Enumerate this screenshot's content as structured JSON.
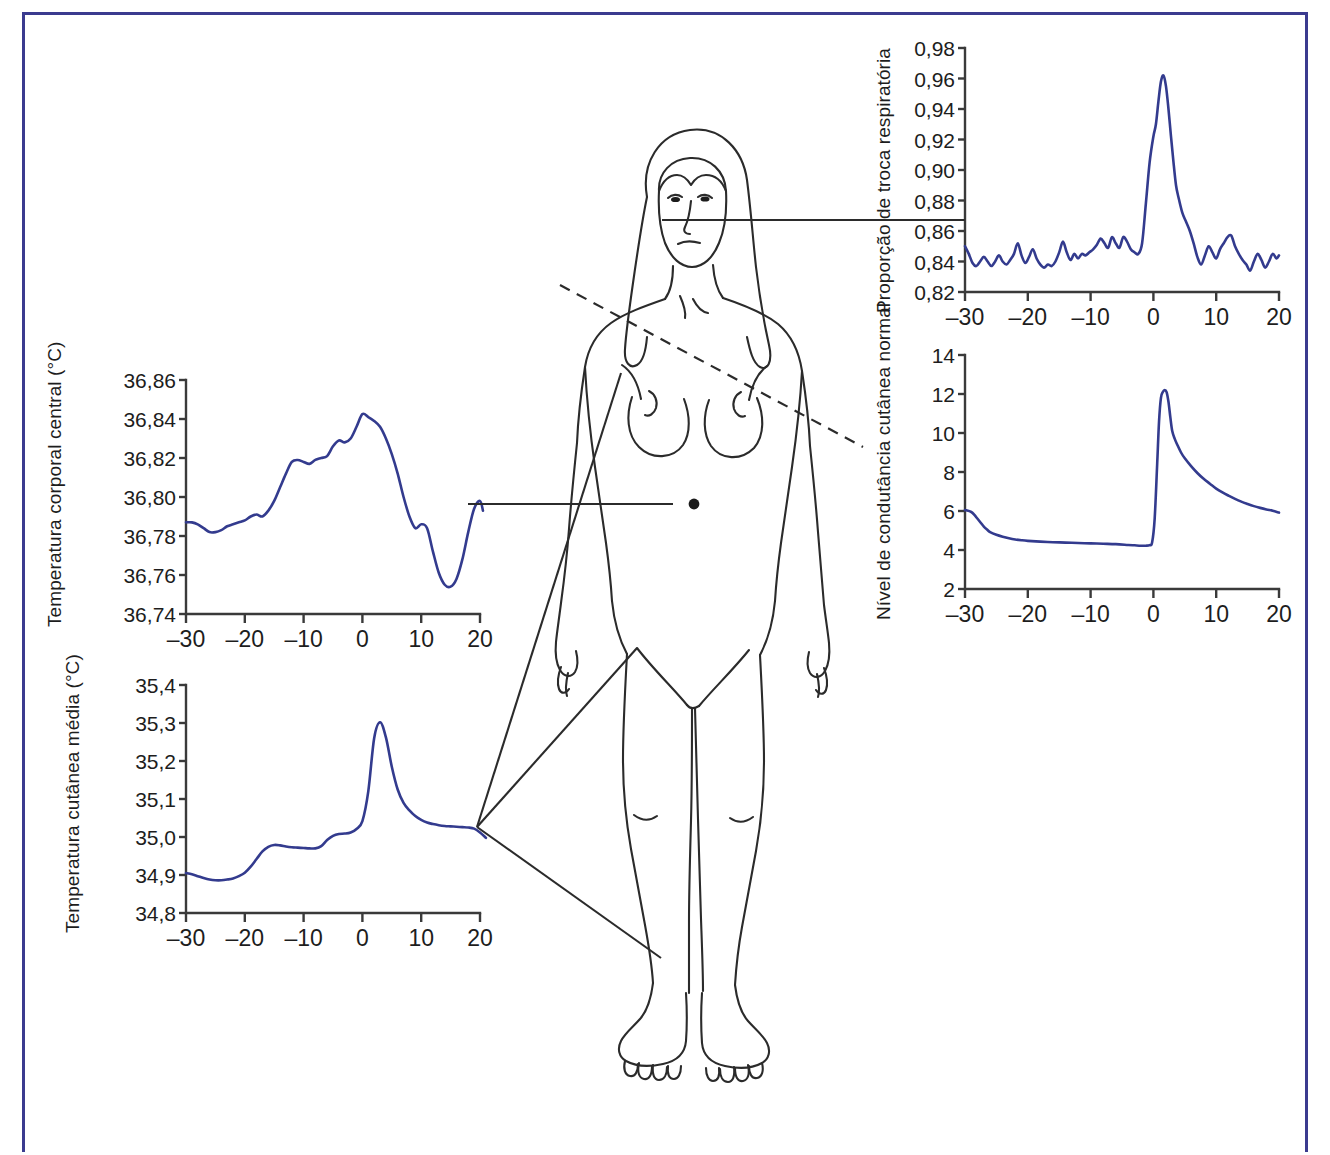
{
  "figure": {
    "border_color": "#3b3b8f",
    "curve_color": "#333b8e",
    "body_line_color": "#2b2b2b"
  },
  "chart_data": [
    {
      "id": "core-body-temperature",
      "type": "line",
      "title": "",
      "ylabel": "Temperatura corporal central (°C)",
      "xlabel": "",
      "xlim": [
        -30,
        20
      ],
      "ylim": [
        36.74,
        36.86
      ],
      "xticks": [
        -30,
        -20,
        -10,
        0,
        10,
        20
      ],
      "xticklabels": [
        "–30",
        "–20",
        "–10",
        "0",
        "10",
        "20"
      ],
      "yticks": [
        36.74,
        36.76,
        36.78,
        36.8,
        36.82,
        36.84,
        36.86
      ],
      "yticklabels": [
        "36,74",
        "36,76",
        "36,78",
        "36,80",
        "36,82",
        "36,84",
        "36,86"
      ],
      "grid": false,
      "legend": "none",
      "x": [
        -30,
        -29,
        -28,
        -27,
        -26,
        -25,
        -24,
        -23,
        -22,
        -21,
        -20,
        -19,
        -18,
        -17,
        -16,
        -15,
        -14,
        -13,
        -12,
        -11,
        -10,
        -9,
        -8,
        -7,
        -6,
        -5,
        -4,
        -3,
        -2,
        -1,
        0,
        1,
        2,
        3,
        4,
        5,
        6,
        7,
        8,
        9,
        10,
        11,
        12,
        13,
        14,
        15,
        16,
        17,
        18,
        19,
        20,
        20.5
      ],
      "values": [
        36.787,
        36.787,
        36.786,
        36.784,
        36.782,
        36.782,
        36.783,
        36.785,
        36.786,
        36.787,
        36.788,
        36.79,
        36.791,
        36.79,
        36.793,
        36.798,
        36.805,
        36.812,
        36.818,
        36.819,
        36.818,
        36.817,
        36.819,
        36.82,
        36.821,
        36.826,
        36.829,
        36.828,
        36.83,
        36.836,
        36.8425,
        36.841,
        36.839,
        36.836,
        36.83,
        36.822,
        36.812,
        36.8,
        36.79,
        36.784,
        36.786,
        36.784,
        36.772,
        36.761,
        36.755,
        36.754,
        36.758,
        36.768,
        36.782,
        36.794,
        36.798,
        36.793
      ]
    },
    {
      "id": "mean-skin-temperature",
      "type": "line",
      "title": "",
      "ylabel": "Temperatura cutânea média (°C)",
      "xlabel": "",
      "xlim": [
        -30,
        20
      ],
      "ylim": [
        34.8,
        35.4
      ],
      "xticks": [
        -30,
        -20,
        -10,
        0,
        10,
        20
      ],
      "xticklabels": [
        "–30",
        "–20",
        "–10",
        "0",
        "10",
        "20"
      ],
      "yticks": [
        34.8,
        34.9,
        35.0,
        35.1,
        35.2,
        35.3,
        35.4
      ],
      "yticklabels": [
        "34,8",
        "34,9",
        "35,0",
        "35,1",
        "35,2",
        "35,3",
        "35,4"
      ],
      "grid": false,
      "legend": "none",
      "x": [
        -30,
        -29,
        -28,
        -27,
        -26,
        -25,
        -24,
        -23,
        -22,
        -21,
        -20,
        -19,
        -18,
        -17,
        -16,
        -15,
        -14,
        -13,
        -12,
        -11,
        -10,
        -9,
        -8,
        -7,
        -6,
        -5,
        -4,
        -3,
        -2,
        -1,
        0,
        1,
        2,
        3,
        4,
        5,
        6,
        7,
        8,
        9,
        10,
        11,
        12,
        13,
        14,
        15,
        16,
        17,
        18,
        19,
        20,
        21
      ],
      "values": [
        34.905,
        34.902,
        34.897,
        34.892,
        34.888,
        34.886,
        34.886,
        34.888,
        34.891,
        34.897,
        34.906,
        34.922,
        34.942,
        34.962,
        34.974,
        34.979,
        34.978,
        34.975,
        34.973,
        34.972,
        34.971,
        34.97,
        34.97,
        34.976,
        34.992,
        35.003,
        35.008,
        35.009,
        35.012,
        35.021,
        35.042,
        35.12,
        35.26,
        35.302,
        35.262,
        35.185,
        35.125,
        35.09,
        35.07,
        35.055,
        35.045,
        35.038,
        35.034,
        35.031,
        35.029,
        35.028,
        35.027,
        35.026,
        35.025,
        35.022,
        35.012,
        34.998
      ]
    },
    {
      "id": "respiratory-exchange-ratio",
      "type": "line",
      "title": "",
      "ylabel": "Proporção de troca respiratória",
      "xlabel": "",
      "xlim": [
        -30,
        20
      ],
      "ylim": [
        0.82,
        0.98
      ],
      "xticks": [
        -30,
        -20,
        -10,
        0,
        10,
        20
      ],
      "xticklabels": [
        "–30",
        "–20",
        "–10",
        "0",
        "10",
        "20"
      ],
      "yticks": [
        0.82,
        0.84,
        0.86,
        0.88,
        0.9,
        0.92,
        0.94,
        0.96,
        0.98
      ],
      "yticklabels": [
        "0,82",
        "0,84",
        "0,86",
        "0,88",
        "0,90",
        "0,92",
        "0,94",
        "0,96",
        "0,98"
      ],
      "grid": false,
      "legend": "none",
      "x": [
        -30,
        -29.4,
        -28.8,
        -28.2,
        -27.6,
        -27,
        -26.4,
        -25.8,
        -25.2,
        -24.6,
        -24,
        -23.4,
        -22.8,
        -22.2,
        -21.6,
        -21,
        -20.4,
        -19.8,
        -19.2,
        -18.6,
        -18,
        -17.4,
        -16.8,
        -16.2,
        -15.6,
        -15,
        -14.4,
        -13.8,
        -13.2,
        -12.6,
        -12,
        -11.4,
        -10.8,
        -10.2,
        -9.6,
        -9,
        -8.4,
        -7.8,
        -7.2,
        -6.6,
        -6,
        -5.4,
        -4.8,
        -4.2,
        -3.6,
        -3,
        -2.4,
        -1.8,
        -1.2,
        -0.6,
        0,
        0.4,
        0.8,
        1.2,
        1.6,
        2,
        2.4,
        2.8,
        3.2,
        3.6,
        4,
        4.6,
        5.2,
        5.8,
        6.4,
        7,
        7.6,
        8.2,
        8.8,
        9.4,
        10,
        10.6,
        11.2,
        11.8,
        12.4,
        13,
        13.6,
        14.2,
        14.8,
        15.4,
        16,
        16.6,
        17.2,
        17.8,
        18.4,
        19,
        19.6,
        20
      ],
      "values": [
        0.85,
        0.845,
        0.839,
        0.837,
        0.84,
        0.843,
        0.84,
        0.837,
        0.84,
        0.844,
        0.84,
        0.838,
        0.841,
        0.845,
        0.852,
        0.844,
        0.839,
        0.843,
        0.848,
        0.842,
        0.838,
        0.836,
        0.838,
        0.837,
        0.84,
        0.846,
        0.853,
        0.846,
        0.841,
        0.845,
        0.842,
        0.845,
        0.844,
        0.846,
        0.848,
        0.851,
        0.855,
        0.852,
        0.849,
        0.856,
        0.852,
        0.849,
        0.856,
        0.853,
        0.848,
        0.846,
        0.845,
        0.852,
        0.878,
        0.905,
        0.922,
        0.93,
        0.945,
        0.958,
        0.962,
        0.955,
        0.94,
        0.922,
        0.905,
        0.89,
        0.882,
        0.872,
        0.866,
        0.86,
        0.852,
        0.843,
        0.838,
        0.844,
        0.85,
        0.846,
        0.842,
        0.848,
        0.852,
        0.856,
        0.857,
        0.85,
        0.845,
        0.841,
        0.838,
        0.834,
        0.84,
        0.845,
        0.841,
        0.836,
        0.84,
        0.845,
        0.842,
        0.844
      ]
    },
    {
      "id": "skin-conductance-level",
      "type": "line",
      "title": "",
      "ylabel": "Nível de condutância cutânea normal",
      "xlabel": "",
      "xlim": [
        -30,
        20
      ],
      "ylim": [
        2,
        14
      ],
      "xticks": [
        -30,
        -20,
        -10,
        0,
        10,
        20
      ],
      "xticklabels": [
        "–30",
        "–20",
        "–10",
        "0",
        "10",
        "20"
      ],
      "yticks": [
        2,
        4,
        6,
        8,
        10,
        12,
        14
      ],
      "yticklabels": [
        "2",
        "4",
        "6",
        "8",
        "10",
        "12",
        "14"
      ],
      "grid": false,
      "legend": "none",
      "x": [
        -30,
        -29,
        -28.5,
        -28,
        -27.5,
        -27,
        -26.5,
        -26,
        -25,
        -24,
        -23,
        -22,
        -21,
        -20,
        -18,
        -16,
        -14,
        -12,
        -10,
        -8,
        -6,
        -4,
        -3,
        -2,
        -1.2,
        -0.6,
        -0.2,
        0.2,
        0.6,
        0.9,
        1.2,
        1.5,
        1.8,
        2.1,
        2.4,
        2.7,
        3,
        3.4,
        3.8,
        4.4,
        5,
        6,
        7,
        8,
        9,
        10,
        11,
        12,
        13,
        14,
        15,
        16,
        17,
        18,
        19,
        20
      ],
      "values": [
        6.05,
        5.95,
        5.8,
        5.6,
        5.4,
        5.2,
        5.05,
        4.92,
        4.78,
        4.68,
        4.6,
        4.54,
        4.5,
        4.47,
        4.43,
        4.4,
        4.38,
        4.36,
        4.34,
        4.32,
        4.3,
        4.26,
        4.24,
        4.22,
        4.22,
        4.25,
        4.4,
        5.6,
        8.4,
        10.6,
        11.8,
        12.1,
        12.2,
        12.1,
        11.6,
        10.8,
        10.1,
        9.7,
        9.4,
        9.0,
        8.7,
        8.3,
        7.95,
        7.65,
        7.4,
        7.15,
        6.95,
        6.78,
        6.62,
        6.48,
        6.36,
        6.25,
        6.16,
        6.08,
        6.01,
        5.92
      ]
    }
  ],
  "body_diagram": {
    "label": "Figura feminina em vista frontal",
    "annotations": [
      {
        "id": "mouth-connector",
        "target": "boca",
        "chart": "respiratory-exchange-ratio",
        "style": "solid"
      },
      {
        "id": "chest-connector",
        "target": "tórax",
        "chart": "skin-conductance-level",
        "style": "dashed"
      },
      {
        "id": "navel-connector",
        "target": "abdômen",
        "chart": "core-body-temperature",
        "style": "solid"
      },
      {
        "id": "skin-sites-connector",
        "target": "pele",
        "chart": "mean-skin-temperature",
        "style": "solid-fan"
      }
    ]
  }
}
